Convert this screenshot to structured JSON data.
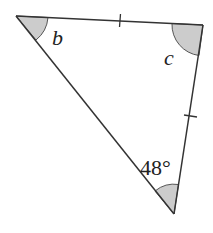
{
  "diagram": {
    "type": "triangle",
    "vertices": {
      "top_left": {
        "x": 16,
        "y": 16
      },
      "top_right": {
        "x": 203,
        "y": 25
      },
      "bottom": {
        "x": 174,
        "y": 214
      }
    },
    "angles": {
      "top_left": {
        "label": "b"
      },
      "top_right": {
        "label": "c"
      },
      "bottom": {
        "label": "48°"
      }
    },
    "equal_sides": [
      "top_left-top_right",
      "top_right-bottom"
    ],
    "colors": {
      "line": "#333333",
      "shade": "#cccccc",
      "text": "#222222"
    }
  }
}
